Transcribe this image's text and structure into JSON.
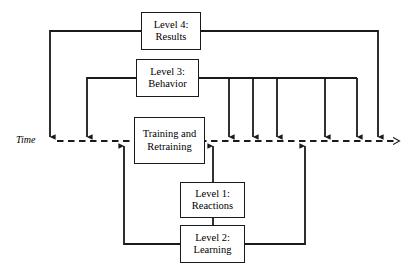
{
  "diagram": {
    "background_color": "#ffffff",
    "line_color": "#1a1a1a",
    "text_color": "#000000",
    "axis": {
      "label": "Time",
      "style": "dashed-arrow",
      "label_x": 16,
      "label_y": 134,
      "y": 141,
      "x_start": 57,
      "x_end": 394
    },
    "nodes": [
      {
        "id": "level4",
        "name": "level-4-results",
        "line1": "Level 4:",
        "line2": "Results",
        "x": 141,
        "y": 12,
        "w": 60,
        "h": 38
      },
      {
        "id": "level3",
        "name": "level-3-behavior",
        "line1": "Level 3:",
        "line2": "Behavior",
        "x": 136,
        "y": 59,
        "w": 63,
        "h": 38
      },
      {
        "id": "training",
        "name": "training-and-retraining",
        "line1": "Training and",
        "line2": "Retraining",
        "x": 134,
        "y": 117,
        "w": 71,
        "h": 47
      },
      {
        "id": "level1",
        "name": "level-1-reactions",
        "line1": "Level 1:",
        "line2": "Reactions",
        "x": 180,
        "y": 182,
        "w": 65,
        "h": 36
      },
      {
        "id": "level2",
        "name": "level-2-learning",
        "line1": "Level 2:",
        "line2": "Learning",
        "x": 180,
        "y": 225,
        "w": 65,
        "h": 38
      }
    ],
    "connectors": [
      {
        "name": "level4-left-feedback",
        "from": "level4",
        "to": "time-axis",
        "path": "M 141 31 L 50 31 L 50 137",
        "arrow": "down"
      },
      {
        "name": "level4-right-feedback",
        "from": "level4",
        "to": "time-axis",
        "path": "M 201 31 L 378 31 L 378 137",
        "arrow": "down"
      },
      {
        "name": "level3-left-feedback",
        "from": "level3",
        "to": "time-axis",
        "path": "M 136 78 L 87 78 L 87 137",
        "arrow": "down"
      },
      {
        "name": "level3-right-trunk",
        "from": "level3",
        "to": "time-axis",
        "path": "M 199 78 L 357 78",
        "arrow": "none"
      },
      {
        "name": "level3-drop-1",
        "from": "level3",
        "to": "time-axis",
        "path": "M 229 78 L 229 137",
        "arrow": "down"
      },
      {
        "name": "level3-drop-2",
        "from": "level3",
        "to": "time-axis",
        "path": "M 253 78 L 253 137",
        "arrow": "down"
      },
      {
        "name": "level3-drop-3",
        "from": "level3",
        "to": "time-axis",
        "path": "M 277 78 L 277 137",
        "arrow": "down"
      },
      {
        "name": "level3-drop-4",
        "from": "level3",
        "to": "time-axis",
        "path": "M 325 78 L 325 137",
        "arrow": "down"
      },
      {
        "name": "level3-drop-5",
        "from": "level3",
        "to": "time-axis",
        "path": "M 357 78 L 357 137",
        "arrow": "down"
      },
      {
        "name": "level2-left-return",
        "from": "level2",
        "to": "time-axis",
        "path": "M 180 244 L 124 244 L 124 146",
        "arrow": "up"
      },
      {
        "name": "level2-right-return",
        "from": "level2",
        "to": "time-axis",
        "path": "M 245 244 L 305 244 L 305 146",
        "arrow": "up"
      },
      {
        "name": "level1-to-level2",
        "from": "level1",
        "to": "level2",
        "path": "M 213 218 L 213 225",
        "arrow": "none"
      },
      {
        "name": "level1-up-to-axis",
        "from": "level1",
        "to": "time-axis",
        "path": "M 213 182 L 213 146",
        "arrow": "up"
      }
    ]
  }
}
